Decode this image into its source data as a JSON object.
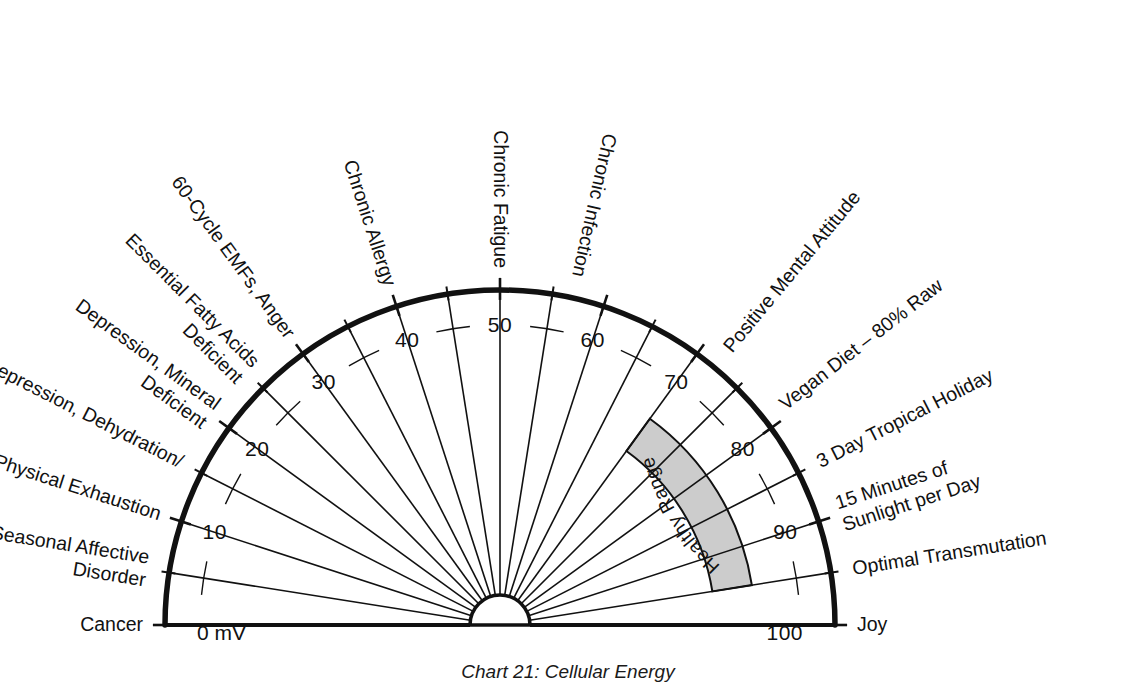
{
  "chart_data": {
    "type": "gauge",
    "title": "Cellular Energy",
    "caption": "Chart 21: Cellular Energy",
    "unit": "mV",
    "axis": {
      "min": 0,
      "max": 100,
      "start_angle_deg": 180,
      "end_angle_deg": 0,
      "major_step": 10,
      "minor_step": 5,
      "major_tick_labels": [
        "0",
        "10",
        "20",
        "30",
        "40",
        "50",
        "60",
        "70",
        "80",
        "90",
        "100"
      ],
      "zero_label": "0 mV",
      "hundred_label": "100"
    },
    "bands": [
      {
        "label": "Healthy Range",
        "from": 70,
        "to": 95,
        "color": "#cccccc",
        "stroke": "#111111"
      }
    ],
    "spoke_labels": [
      {
        "value": 0,
        "text": "Cancer",
        "side": "left",
        "lines": [
          "Cancer"
        ]
      },
      {
        "value": 5,
        "text": "Seasonal Affective Disorder",
        "side": "left",
        "lines": [
          "Seasonal Affective",
          "Disorder"
        ]
      },
      {
        "value": 10,
        "text": "Physical Exhaustion",
        "side": "left",
        "lines": [
          "Physical Exhaustion"
        ]
      },
      {
        "value": 15,
        "text": "Depression, Dehydration/",
        "side": "left",
        "lines": [
          "Depression, Dehydration/"
        ]
      },
      {
        "value": 20,
        "text": "Depression, Mineral Deficient",
        "side": "left",
        "lines": [
          "Depression, Mineral",
          "Deficient"
        ]
      },
      {
        "value": 25,
        "text": "Essential Fatty Acids Deficient",
        "side": "left",
        "lines": [
          "Essential Fatty Acids",
          "Deficient"
        ]
      },
      {
        "value": 30,
        "text": "60-Cycle EMFs, Anger",
        "side": "left",
        "lines": [
          "60-Cycle EMFs, Anger"
        ]
      },
      {
        "value": 40,
        "text": "Chronic Allergy",
        "side": "left",
        "lines": [
          "Chronic Allergy"
        ]
      },
      {
        "value": 50,
        "text": "Chronic Fatigue",
        "side": "left",
        "lines": [
          "Chronic Fatigue"
        ]
      },
      {
        "value": 57,
        "text": "Chronic Infection",
        "side": "left",
        "lines": [
          "Chronic Infection"
        ]
      },
      {
        "value": 72,
        "text": "Positive Mental Attitude",
        "side": "right",
        "lines": [
          "Positive Mental Attitude"
        ]
      },
      {
        "value": 79,
        "text": "Vegan Diet – 80% Raw",
        "side": "right",
        "lines": [
          "Vegan Diet – 80% Raw"
        ]
      },
      {
        "value": 85,
        "text": "3 Day Tropical Holiday",
        "side": "right",
        "lines": [
          "3 Day Tropical Holiday"
        ]
      },
      {
        "value": 90,
        "text": "15 Minutes of Sunlight per Day",
        "side": "right",
        "lines": [
          "15 Minutes of",
          "Sunlight per Day"
        ]
      },
      {
        "value": 95,
        "text": "Optimal Transmutation",
        "side": "right",
        "lines": [
          "Optimal Transmutation"
        ]
      },
      {
        "value": 100,
        "text": "Joy",
        "side": "right",
        "lines": [
          "Joy"
        ]
      }
    ],
    "geometry": {
      "cx": 500,
      "cy": 625,
      "outer_radius": 335,
      "inner_number_radius": 300,
      "hub_radius": 30,
      "band_inner_radius": 215,
      "band_outer_radius": 255,
      "tick_major_len": 22,
      "tick_minor_len": 14
    },
    "colors": {
      "stroke": "#111111",
      "band_fill": "#cccccc",
      "background": "#ffffff"
    }
  }
}
